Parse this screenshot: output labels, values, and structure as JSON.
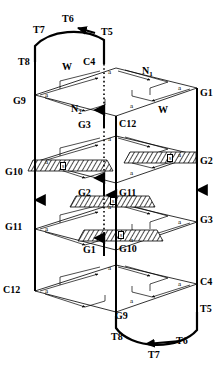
{
  "figure": {
    "type": "schematic-3d-lattice",
    "layer_count": 4,
    "edge_label": "a",
    "hatch_label": "s",
    "colors": {
      "stroke": "#000000",
      "background": "#ffffff",
      "hatch": "#000000"
    }
  },
  "left_chain": {
    "name": "left-vertical-chain",
    "labels": [
      {
        "id": "T8",
        "text": "T8",
        "x": 18,
        "y": 57
      },
      {
        "id": "G9",
        "text": "G9",
        "x": 13,
        "y": 96
      },
      {
        "id": "G10",
        "text": "G10",
        "x": 8,
        "y": 167
      },
      {
        "id": "G11",
        "text": "G11",
        "x": 8,
        "y": 222
      },
      {
        "id": "C12",
        "text": "C12",
        "x": 6,
        "y": 285
      }
    ],
    "arrow_direction": "down"
  },
  "right_chain": {
    "name": "right-vertical-chain",
    "labels": [
      {
        "id": "G1",
        "text": "G1",
        "x": 197,
        "y": 88
      },
      {
        "id": "G2",
        "text": "G2",
        "x": 197,
        "y": 159
      },
      {
        "id": "G3",
        "text": "G3",
        "x": 197,
        "y": 215
      },
      {
        "id": "C4",
        "text": "C4",
        "x": 197,
        "y": 279
      },
      {
        "id": "T5",
        "text": "T5",
        "x": 197,
        "y": 306
      }
    ],
    "arrow_direction": "down"
  },
  "center_solid_chain": {
    "name": "center-solid-chain",
    "labels": [
      {
        "id": "C12c",
        "text": "C12",
        "x": 121,
        "y": 121
      },
      {
        "id": "G11c",
        "text": "G11",
        "x": 121,
        "y": 192
      },
      {
        "id": "G10c",
        "text": "G10",
        "x": 121,
        "y": 248
      },
      {
        "id": "G9c",
        "text": "G9",
        "x": 116,
        "y": 309
      }
    ],
    "arrow_direction": "up"
  },
  "center_dotted_chain": {
    "name": "center-dotted-chain",
    "labels": [
      {
        "id": "C4c",
        "text": "C4",
        "x": 84,
        "y": 59
      },
      {
        "id": "G3c",
        "text": "G3",
        "x": 79,
        "y": 123
      },
      {
        "id": "G2c",
        "text": "G2",
        "x": 79,
        "y": 191
      },
      {
        "id": "G1c",
        "text": "G1",
        "x": 84,
        "y": 248
      }
    ],
    "arrow_direction": "up"
  },
  "twin_labels_top": [
    {
      "id": "T6t",
      "text": "T6",
      "x": 62,
      "y": 14
    },
    {
      "id": "T7t",
      "text": "T7",
      "x": 33,
      "y": 25
    },
    {
      "id": "T5t",
      "text": "T5",
      "x": 101,
      "y": 27
    },
    {
      "id": "T8t",
      "text": "T8",
      "x": 18,
      "y": 57
    }
  ],
  "twin_labels_bottom": [
    {
      "id": "T8b",
      "text": "T8",
      "x": 113,
      "y": 334
    },
    {
      "id": "T7b",
      "text": "T7",
      "x": 148,
      "y": 350
    },
    {
      "id": "T6b",
      "text": "T6",
      "x": 178,
      "y": 338
    },
    {
      "id": "T5b",
      "text": "T5",
      "x": 197,
      "y": 306
    }
  ],
  "direction_labels": [
    {
      "id": "W-top",
      "text": "W",
      "x": 62,
      "y": 65
    },
    {
      "id": "N1",
      "text": "N",
      "sub": "1",
      "x": 143,
      "y": 69
    },
    {
      "id": "N2",
      "text": "N",
      "sub": "2",
      "x": 72,
      "y": 106
    },
    {
      "id": "W-mid",
      "text": "W",
      "x": 159,
      "y": 108
    }
  ],
  "edge_a_labels": [
    {
      "x": 110,
      "y": 72
    },
    {
      "x": 180,
      "y": 88
    },
    {
      "x": 46,
      "y": 95
    },
    {
      "x": 131,
      "y": 106
    },
    {
      "x": 110,
      "y": 139
    },
    {
      "x": 180,
      "y": 155
    },
    {
      "x": 46,
      "y": 162
    },
    {
      "x": 131,
      "y": 173
    },
    {
      "x": 110,
      "y": 207
    },
    {
      "x": 180,
      "y": 222
    },
    {
      "x": 46,
      "y": 229
    },
    {
      "x": 131,
      "y": 240
    },
    {
      "x": 110,
      "y": 268
    },
    {
      "x": 180,
      "y": 284
    },
    {
      "x": 46,
      "y": 291
    },
    {
      "x": 131,
      "y": 301
    }
  ],
  "hatch_bands": [
    {
      "id": "s-left-upper",
      "label": "s",
      "sx": 60,
      "sy": 166
    },
    {
      "id": "s-right-upper",
      "label": "s",
      "sx": 167,
      "sy": 158
    },
    {
      "id": "s-center-back",
      "label": "s",
      "sx": 111,
      "sy": 202
    },
    {
      "id": "s-center-front",
      "label": "s",
      "sx": 119,
      "sy": 235
    }
  ]
}
